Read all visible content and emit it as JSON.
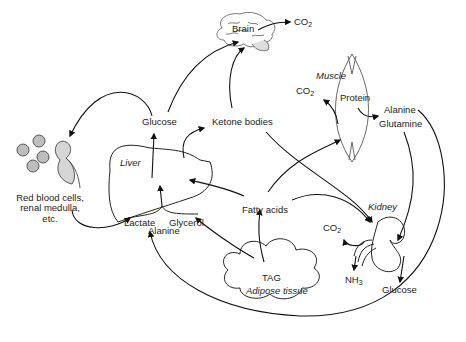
{
  "organs": {
    "brain": "Brain",
    "muscle": "Muscle",
    "liver": "Liver",
    "kidney": "Kidney",
    "adipose": "Adipose tissue",
    "rbc": [
      "Red blood cells,",
      "renal medulla,",
      "etc."
    ]
  },
  "metabolites": {
    "brain_co2": "CO",
    "muscle_co2": "CO",
    "kidney_co2": "CO",
    "co2_sub": "2",
    "protein": "Protein",
    "muscle_alanine": "Alanine",
    "muscle_glutamine": "Glutamine",
    "glucose_liver": "Glucose",
    "ketone_bodies": "Ketone bodies",
    "fatty_acids": "Fatty acids",
    "lactate": "Lactate",
    "alanine_liver": "Alanine",
    "glycerol": "Glycerol",
    "tag": "TAG",
    "nh3": "NH",
    "nh3_sub": "3",
    "kidney_glucose": "Glucose"
  },
  "colors": {
    "line": "#111111",
    "organ_stroke": "#555555",
    "cell_fill": "#bdbdbd",
    "kidney_fill": "#d6d6d6"
  }
}
